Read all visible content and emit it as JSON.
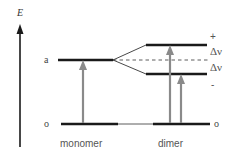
{
  "axis": {
    "label": "E"
  },
  "levels": {
    "excited_label": "a",
    "ground_label_left": "o",
    "ground_label_right": "o",
    "plus_label": "+",
    "minus_label": "-",
    "splitting_upper": "Δν",
    "splitting_lower": "Δν"
  },
  "labels": {
    "monomer": "monomer",
    "dimer": "dimer"
  },
  "colors": {
    "level": "#1a1a1a",
    "arrow": "#8a8a8a",
    "text": "#555555"
  }
}
